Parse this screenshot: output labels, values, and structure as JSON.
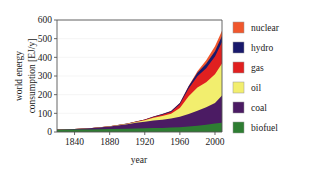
{
  "chart_data": {
    "type": "area",
    "title": "",
    "xlabel": "year",
    "ylabel": "world energy consumption [EJ/y]",
    "ylabel_line1": "world energy",
    "ylabel_line2": "consumption [EJ/y]",
    "xlim": [
      1820,
      2008
    ],
    "ylim": [
      0,
      600
    ],
    "xticks": [
      1840,
      1880,
      1920,
      1960,
      2000
    ],
    "xtick_labels": [
      "1840",
      "1880",
      "1920",
      "1960",
      "2000"
    ],
    "yticks": [
      0,
      100,
      200,
      300,
      400,
      500,
      600
    ],
    "ytick_labels": [
      "0",
      "100",
      "200",
      "300",
      "400",
      "500",
      "600"
    ],
    "grid": true,
    "legend_position": "right",
    "stacked": true,
    "x": [
      1820,
      1840,
      1860,
      1880,
      1900,
      1910,
      1920,
      1930,
      1940,
      1950,
      1960,
      1970,
      1980,
      1990,
      2000,
      2008
    ],
    "series": [
      {
        "name": "biofuel",
        "color": "#2e7d32",
        "values": [
          12,
          13,
          14,
          16,
          18,
          19,
          20,
          21,
          22,
          24,
          26,
          30,
          34,
          39,
          45,
          50
        ]
      },
      {
        "name": "coal",
        "color": "#4b1b63",
        "values": [
          1,
          3,
          7,
          14,
          24,
          31,
          35,
          40,
          44,
          48,
          56,
          66,
          80,
          93,
          110,
          145
        ]
      },
      {
        "name": "oil",
        "color": "#f2ee6e",
        "values": [
          0,
          0,
          0,
          1,
          2,
          4,
          8,
          15,
          20,
          26,
          46,
          95,
          125,
          135,
          155,
          172
        ]
      },
      {
        "name": "gas",
        "color": "#e02020",
        "values": [
          0,
          0,
          0,
          0,
          0,
          1,
          2,
          4,
          6,
          9,
          20,
          42,
          60,
          75,
          95,
          115
        ]
      },
      {
        "name": "hydro",
        "color": "#19196b",
        "values": [
          0,
          0,
          0,
          0,
          1,
          1,
          2,
          3,
          4,
          5,
          7,
          12,
          18,
          23,
          28,
          32
        ]
      },
      {
        "name": "nuclear",
        "color": "#f0572d",
        "values": [
          0,
          0,
          0,
          0,
          0,
          0,
          0,
          0,
          0,
          0,
          0,
          2,
          8,
          20,
          26,
          28
        ]
      }
    ],
    "totals_note": ""
  },
  "legend": {
    "items": [
      {
        "label": "nuclear",
        "color": "#f0572d"
      },
      {
        "label": "hydro",
        "color": "#19196b"
      },
      {
        "label": "gas",
        "color": "#e02020"
      },
      {
        "label": "oil",
        "color": "#f2ee6e"
      },
      {
        "label": "coal",
        "color": "#4b1b63"
      },
      {
        "label": "biofuel",
        "color": "#2e7d32"
      }
    ]
  }
}
